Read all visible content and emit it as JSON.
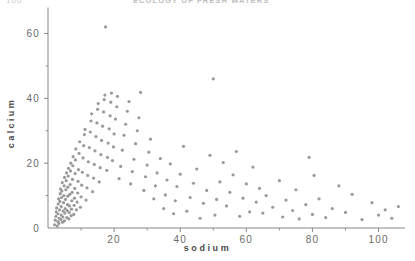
{
  "header": {
    "page_number": "100",
    "running_title": "ECOLOGY OF FRESH WATERS"
  },
  "chart_data": {
    "type": "scatter",
    "title": "",
    "xlabel": "sodium",
    "ylabel": "calcium",
    "xlim": [
      0,
      108
    ],
    "ylim": [
      0,
      66
    ],
    "grid": false,
    "legend": null,
    "xticks": [
      20,
      40,
      60,
      80,
      100
    ],
    "xtick_labels": [
      "20",
      "40",
      "60",
      "80",
      "100"
    ],
    "x_minor_ticks": [
      10,
      30,
      50,
      70,
      90
    ],
    "yticks": [
      0,
      20,
      40,
      60
    ],
    "ytick_labels": [
      "0",
      "20",
      "40",
      "60"
    ],
    "y_minor_ticks": [
      10,
      30,
      50
    ],
    "marker": "dot",
    "marker_color": "#9a9a9a",
    "marker_size": 1.6,
    "points": [
      [
        2.0,
        1.0
      ],
      [
        2.2,
        2.4
      ],
      [
        2.4,
        3.6
      ],
      [
        2.5,
        5.0
      ],
      [
        2.6,
        6.2
      ],
      [
        2.8,
        0.6
      ],
      [
        3.0,
        2.0
      ],
      [
        3.0,
        4.4
      ],
      [
        3.1,
        7.4
      ],
      [
        3.2,
        9.0
      ],
      [
        3.3,
        1.4
      ],
      [
        3.4,
        3.0
      ],
      [
        3.5,
        5.6
      ],
      [
        3.6,
        8.2
      ],
      [
        3.7,
        10.6
      ],
      [
        3.8,
        12.0
      ],
      [
        3.9,
        2.6
      ],
      [
        4.0,
        4.0
      ],
      [
        4.0,
        6.6
      ],
      [
        4.1,
        9.4
      ],
      [
        4.2,
        11.4
      ],
      [
        4.3,
        14.0
      ],
      [
        4.4,
        1.8
      ],
      [
        4.5,
        3.4
      ],
      [
        4.6,
        5.2
      ],
      [
        4.7,
        7.8
      ],
      [
        4.8,
        10.0
      ],
      [
        4.9,
        13.0
      ],
      [
        5.0,
        15.6
      ],
      [
        5.0,
        2.2
      ],
      [
        5.1,
        4.6
      ],
      [
        5.2,
        6.0
      ],
      [
        5.3,
        8.8
      ],
      [
        5.4,
        11.8
      ],
      [
        5.5,
        14.6
      ],
      [
        5.6,
        17.0
      ],
      [
        5.7,
        3.2
      ],
      [
        5.8,
        5.4
      ],
      [
        5.9,
        7.2
      ],
      [
        6.0,
        9.8
      ],
      [
        6.0,
        12.6
      ],
      [
        6.1,
        16.0
      ],
      [
        6.2,
        18.4
      ],
      [
        6.3,
        2.8
      ],
      [
        6.4,
        4.8
      ],
      [
        6.5,
        6.8
      ],
      [
        6.6,
        10.4
      ],
      [
        6.7,
        13.4
      ],
      [
        6.8,
        17.6
      ],
      [
        6.9,
        20.0
      ],
      [
        7.0,
        3.8
      ],
      [
        7.1,
        5.8
      ],
      [
        7.2,
        8.4
      ],
      [
        7.3,
        11.0
      ],
      [
        7.4,
        15.0
      ],
      [
        7.5,
        19.2
      ],
      [
        7.6,
        22.0
      ],
      [
        7.8,
        4.2
      ],
      [
        7.9,
        7.0
      ],
      [
        8.0,
        9.2
      ],
      [
        8.1,
        12.2
      ],
      [
        8.2,
        16.8
      ],
      [
        8.3,
        21.0
      ],
      [
        8.4,
        24.4
      ],
      [
        8.6,
        5.6
      ],
      [
        8.8,
        8.0
      ],
      [
        9.0,
        10.8
      ],
      [
        9.1,
        14.4
      ],
      [
        9.2,
        18.0
      ],
      [
        9.4,
        23.0
      ],
      [
        9.6,
        26.6
      ],
      [
        9.8,
        6.4
      ],
      [
        10.0,
        9.6
      ],
      [
        10.2,
        13.2
      ],
      [
        10.4,
        17.2
      ],
      [
        10.6,
        21.6
      ],
      [
        10.8,
        25.4
      ],
      [
        11.0,
        28.8
      ],
      [
        11.2,
        30.4
      ],
      [
        11.5,
        8.6
      ],
      [
        11.8,
        12.4
      ],
      [
        12.0,
        16.2
      ],
      [
        12.2,
        20.4
      ],
      [
        12.5,
        24.8
      ],
      [
        12.8,
        29.6
      ],
      [
        13.0,
        33.0
      ],
      [
        13.2,
        35.2
      ],
      [
        13.5,
        11.2
      ],
      [
        13.8,
        15.4
      ],
      [
        14.0,
        19.6
      ],
      [
        14.2,
        23.8
      ],
      [
        14.5,
        28.2
      ],
      [
        14.8,
        32.4
      ],
      [
        15.0,
        36.6
      ],
      [
        15.2,
        38.4
      ],
      [
        15.5,
        14.2
      ],
      [
        15.8,
        18.6
      ],
      [
        16.0,
        22.6
      ],
      [
        16.2,
        27.0
      ],
      [
        16.5,
        31.4
      ],
      [
        16.8,
        35.8
      ],
      [
        17.0,
        39.6
      ],
      [
        17.2,
        41.0
      ],
      [
        17.4,
        62.0
      ],
      [
        17.8,
        17.8
      ],
      [
        18.0,
        21.8
      ],
      [
        18.2,
        26.2
      ],
      [
        18.5,
        30.6
      ],
      [
        18.8,
        34.6
      ],
      [
        19.0,
        38.8
      ],
      [
        19.2,
        41.6
      ],
      [
        19.5,
        20.8
      ],
      [
        19.8,
        25.0
      ],
      [
        20.0,
        29.0
      ],
      [
        20.4,
        33.6
      ],
      [
        20.8,
        37.4
      ],
      [
        21.0,
        40.6
      ],
      [
        21.5,
        15.2
      ],
      [
        22.0,
        19.0
      ],
      [
        22.5,
        24.0
      ],
      [
        23.0,
        28.6
      ],
      [
        23.5,
        32.0
      ],
      [
        24.0,
        36.0
      ],
      [
        24.5,
        39.0
      ],
      [
        25.0,
        13.6
      ],
      [
        25.5,
        17.4
      ],
      [
        26.0,
        21.2
      ],
      [
        26.5,
        26.0
      ],
      [
        27.0,
        30.0
      ],
      [
        27.5,
        34.0
      ],
      [
        28.0,
        41.8
      ],
      [
        29.0,
        11.6
      ],
      [
        29.5,
        15.8
      ],
      [
        30.0,
        19.4
      ],
      [
        30.5,
        23.4
      ],
      [
        31.0,
        27.4
      ],
      [
        32.0,
        9.0
      ],
      [
        32.5,
        13.0
      ],
      [
        33.0,
        17.0
      ],
      [
        34.0,
        21.4
      ],
      [
        35.0,
        6.0
      ],
      [
        35.5,
        10.2
      ],
      [
        36.0,
        14.8
      ],
      [
        37.0,
        19.8
      ],
      [
        38.0,
        4.4
      ],
      [
        38.5,
        8.4
      ],
      [
        39.0,
        12.8
      ],
      [
        40.0,
        16.6
      ],
      [
        41.0,
        25.2
      ],
      [
        42.0,
        5.2
      ],
      [
        43.0,
        9.4
      ],
      [
        44.0,
        13.8
      ],
      [
        45.0,
        18.2
      ],
      [
        46.0,
        3.0
      ],
      [
        47.0,
        7.6
      ],
      [
        48.0,
        11.6
      ],
      [
        49.0,
        22.4
      ],
      [
        50.0,
        46.0
      ],
      [
        50.5,
        4.0
      ],
      [
        51.0,
        8.8
      ],
      [
        52.0,
        14.2
      ],
      [
        53.0,
        20.2
      ],
      [
        54.0,
        6.8
      ],
      [
        55.0,
        11.0
      ],
      [
        56.0,
        16.4
      ],
      [
        57.0,
        23.6
      ],
      [
        58.0,
        3.6
      ],
      [
        59.0,
        9.2
      ],
      [
        60.0,
        13.6
      ],
      [
        61.0,
        5.0
      ],
      [
        62.0,
        18.8
      ],
      [
        63.0,
        8.0
      ],
      [
        64.0,
        12.2
      ],
      [
        65.0,
        4.6
      ],
      [
        66.0,
        10.0
      ],
      [
        68.0,
        6.4
      ],
      [
        70.0,
        14.6
      ],
      [
        71.0,
        3.4
      ],
      [
        72.0,
        8.6
      ],
      [
        74.0,
        5.4
      ],
      [
        75.0,
        11.8
      ],
      [
        76.0,
        2.8
      ],
      [
        78.0,
        7.2
      ],
      [
        79.0,
        21.8
      ],
      [
        80.0,
        4.2
      ],
      [
        80.5,
        16.2
      ],
      [
        82.0,
        9.0
      ],
      [
        84.0,
        3.2
      ],
      [
        86.0,
        6.0
      ],
      [
        88.0,
        13.0
      ],
      [
        90.0,
        4.8
      ],
      [
        92.0,
        10.4
      ],
      [
        95.0,
        2.6
      ],
      [
        98.0,
        7.8
      ],
      [
        100.0,
        4.0
      ],
      [
        102.0,
        5.6
      ],
      [
        104.0,
        3.0
      ],
      [
        106.0,
        6.6
      ]
    ]
  }
}
